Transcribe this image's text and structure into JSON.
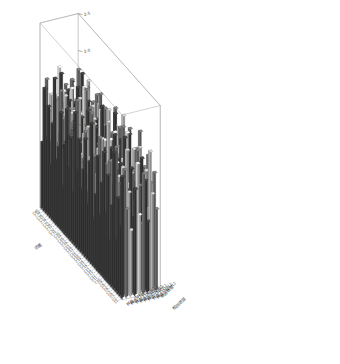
{
  "chart_data": {
    "type": "bar",
    "title": "",
    "subtitle": "",
    "projection": "3d",
    "xlabel": "浓度",
    "ylabel": "检测项目",
    "zlabel": "浓度 (mg/L)",
    "grid": false,
    "legend": null,
    "zlim": [
      0.0,
      2.5
    ],
    "ztick_labels": [
      "0.5",
      "1.0",
      "1.5",
      "2.0",
      "2.5"
    ],
    "ztick_values": [
      0.5,
      1.0,
      1.5,
      2.0,
      2.5
    ],
    "colors": {
      "bar_dark": "#3c3c3c",
      "bar_mid": "#6e6e6e",
      "bar_light": "#b4b4b4",
      "bar_pale": "#d2d2d2",
      "pane_edge": "#9a9a9a",
      "background": "#ffffff",
      "text": "#2b2b2b"
    },
    "y_categories": [
      "样品 (5mL)",
      "样品 (10mL)",
      "样品 (15mL)",
      "样品 (20mL)",
      "样品 (25mL)",
      "样品 (30mL)",
      "样品 (35mL)",
      "样品 (40mL)",
      "检测项目"
    ],
    "x_categories": [
      "C1",
      "C2",
      "C3",
      "C4",
      "C5",
      "C6",
      "C7",
      "C8",
      "C9",
      "C10",
      "C11",
      "C12",
      "C13",
      "C14",
      "C15",
      "C16",
      "C17",
      "C18",
      "C19",
      "C20",
      "C21",
      "C22",
      "C23",
      "C24",
      "C25",
      "C26",
      "C27",
      "C28",
      "C29",
      "C30",
      "C31",
      "C32",
      "C33",
      "C34",
      "C35",
      "C36",
      "C37",
      "C38",
      "C39",
      "C40"
    ],
    "series": [
      {
        "name": "样品 (5mL)",
        "values": [
          1.65,
          0.95,
          1.3,
          0.7,
          1.85,
          1.1,
          0.6,
          1.45,
          0.9,
          1.7,
          1.25,
          0.8,
          1.55,
          1.0,
          0.65,
          1.9,
          1.35,
          0.75,
          1.6,
          1.15,
          0.85,
          1.5,
          1.05,
          1.8,
          0.7,
          1.4,
          0.95,
          1.72,
          1.2,
          0.62,
          1.58,
          1.08,
          0.88,
          1.95,
          1.3,
          0.72,
          1.48,
          1.02,
          1.66,
          0.9
        ]
      },
      {
        "name": "样品 (10mL)",
        "values": [
          1.2,
          1.7,
          0.8,
          1.45,
          1.05,
          1.88,
          0.95,
          1.32,
          1.6,
          0.72,
          1.5,
          1.18,
          0.9,
          1.76,
          1.28,
          0.68,
          1.42,
          1.96,
          1.1,
          0.85,
          1.62,
          1.22,
          0.78,
          1.38,
          1.92,
          1.0,
          1.55,
          0.92,
          1.68,
          1.12,
          0.82,
          1.46,
          1.8,
          1.06,
          0.74,
          1.58,
          1.24,
          0.96,
          1.34,
          1.74
        ]
      },
      {
        "name": "样品 (15mL)",
        "values": [
          0.9,
          1.38,
          1.92,
          1.08,
          1.62,
          0.78,
          1.44,
          1.16,
          0.86,
          1.56,
          1.28,
          2.02,
          0.98,
          1.34,
          1.7,
          0.88,
          1.5,
          1.12,
          1.84,
          0.96,
          1.26,
          1.64,
          0.8,
          1.48,
          1.18,
          1.9,
          1.02,
          1.36,
          0.84,
          1.58,
          1.3,
          0.94,
          1.72,
          1.14,
          1.46,
          0.76,
          1.6,
          1.22,
          0.92,
          1.52
        ]
      },
      {
        "name": "样品 (20mL)",
        "values": [
          1.44,
          1.02,
          1.66,
          0.88,
          1.3,
          1.98,
          1.12,
          1.56,
          0.82,
          1.4,
          1.86,
          1.06,
          1.62,
          0.94,
          1.24,
          1.52,
          2.06,
          0.9,
          1.36,
          1.68,
          1.0,
          1.46,
          1.14,
          1.78,
          0.86,
          1.28,
          1.6,
          1.08,
          1.94,
          0.98,
          1.42,
          1.2,
          1.64,
          0.84,
          1.54,
          1.26,
          1.88,
          1.04,
          1.48,
          0.92
        ]
      },
      {
        "name": "样品 (25mL)",
        "values": [
          1.08,
          1.74,
          1.2,
          0.86,
          1.52,
          1.34,
          2.0,
          0.96,
          1.58,
          1.16,
          0.8,
          1.44,
          1.82,
          1.1,
          1.66,
          0.92,
          1.26,
          1.56,
          1.04,
          1.9,
          0.88,
          1.38,
          1.62,
          1.18,
          0.94,
          1.7,
          1.32,
          1.96,
          1.0,
          1.54,
          1.22,
          0.82,
          1.48,
          1.76,
          1.12,
          1.4,
          0.9,
          1.6,
          1.3,
          1.86
        ]
      },
      {
        "name": "样品 (30mL)",
        "values": [
          1.62,
          0.92,
          1.4,
          1.84,
          1.14,
          1.5,
          0.86,
          1.28,
          1.68,
          1.06,
          1.94,
          1.22,
          0.9,
          1.46,
          1.74,
          1.02,
          1.58,
          1.18,
          0.84,
          1.36,
          1.66,
          2.04,
          1.1,
          1.42,
          1.24,
          0.96,
          1.7,
          1.34,
          1.88,
          1.08,
          1.52,
          0.88,
          1.6,
          1.16,
          1.44,
          1.8,
          0.94,
          1.38,
          1.64,
          1.26
        ]
      },
      {
        "name": "样品 (35mL)",
        "values": [
          0.96,
          1.48,
          1.18,
          1.72,
          1.04,
          1.6,
          1.3,
          0.88,
          1.42,
          1.86,
          1.12,
          1.54,
          0.94,
          1.66,
          1.36,
          1.08,
          1.92,
          1.2,
          1.5,
          0.86,
          1.62,
          1.14,
          1.4,
          1.78,
          1.02,
          1.56,
          0.9,
          1.46,
          1.24,
          1.68,
          1.06,
          1.34,
          1.96,
          1.18,
          1.58,
          0.98,
          1.44,
          1.7,
          1.1,
          1.52
        ]
      },
      {
        "name": "样品 (40mL)",
        "values": [
          1.32,
          1.86,
          1.06,
          1.54,
          0.92,
          1.42,
          1.76,
          1.2,
          1.0,
          1.64,
          1.38,
          0.88,
          1.58,
          1.26,
          1.94,
          1.14,
          1.46,
          0.96,
          1.68,
          1.34,
          1.08,
          1.8,
          1.22,
          0.9,
          1.5,
          1.16,
          1.72,
          1.04,
          1.4,
          1.6,
          0.94,
          1.88,
          1.28,
          1.02,
          1.66,
          1.36,
          1.18,
          1.44,
          0.98,
          1.56
        ]
      },
      {
        "name": "检测项目",
        "values": [
          1.1,
          1.56,
          0.94,
          1.36,
          1.7,
          1.02,
          1.48,
          1.24,
          1.9,
          0.88,
          1.6,
          1.3,
          1.14,
          1.78,
          0.96,
          1.52,
          1.4,
          1.06,
          1.64,
          1.2,
          1.84,
          0.92,
          1.44,
          1.32,
          1.08,
          1.68,
          1.5,
          0.98,
          1.26,
          1.74,
          1.12,
          1.58,
          1.38,
          0.9,
          1.46,
          1.62,
          1.04,
          1.28,
          1.8,
          1.16
        ]
      }
    ]
  }
}
